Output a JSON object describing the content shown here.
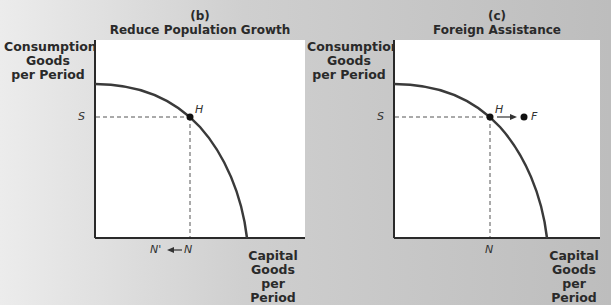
{
  "panels": [
    {
      "id": "b",
      "letter": "(b)",
      "title": "Reduce Population Growth",
      "ylabel": [
        "Consumption",
        "Goods",
        "per Period"
      ],
      "xlabel": [
        "Capital",
        "Goods",
        "per Period"
      ],
      "points": {
        "H": "H",
        "S": "S",
        "N": "N",
        "N_prime": "N'"
      }
    },
    {
      "id": "c",
      "letter": "(c)",
      "title": "Foreign Assistance",
      "ylabel": [
        "Consumption",
        "Goods",
        "per Period"
      ],
      "xlabel": [
        "Capital",
        "Goods",
        "per Period"
      ],
      "points": {
        "H": "H",
        "S": "S",
        "N": "N",
        "F": "F"
      }
    }
  ],
  "colors": {
    "curve": "#3a3a3a",
    "axis": "#2a2a2a",
    "plot_bg": "#ffffff"
  }
}
